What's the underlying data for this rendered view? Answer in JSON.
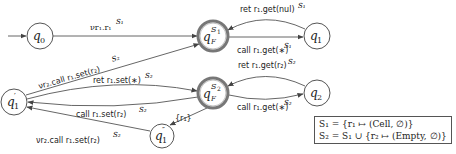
{
  "diagram": {
    "type": "automaton",
    "states": [
      {
        "id": "q0",
        "label": "q0",
        "initial": true,
        "final": false
      },
      {
        "id": "qF_S1",
        "label": "qF",
        "superscript": "S1",
        "final": true
      },
      {
        "id": "q1",
        "label": "q1",
        "final": false
      },
      {
        "id": "q1p",
        "label": "q1′",
        "final": false
      },
      {
        "id": "qF_S2",
        "label": "qF",
        "superscript": "S2",
        "final": true
      },
      {
        "id": "q2",
        "label": "q2",
        "final": false
      },
      {
        "id": "q1pp",
        "label": "q1″",
        "final": false
      }
    ],
    "edges": [
      {
        "from": "q0",
        "to": "qF_S1",
        "label": "ν r1.r1",
        "sup": "S1"
      },
      {
        "from": "q1",
        "to": "qF_S1",
        "label": "ret r1.get(nul)",
        "sup": "S1"
      },
      {
        "from": "qF_S1",
        "to": "q1",
        "label": "call r1.get(∗)",
        "sup": "S1"
      },
      {
        "from": "q1p",
        "to": "qF_S1",
        "label": "ν r2.call r1.set(r2)",
        "sup": "S2"
      },
      {
        "from": "q1p",
        "to": "qF_S2",
        "label": "ret r1.set(∗)",
        "sup": "S2"
      },
      {
        "from": "qF_S2",
        "to": "q1p",
        "label": "call r1.set(r2)",
        "sup": "S2"
      },
      {
        "from": "q2",
        "to": "qF_S2",
        "label": "ret r1.get(r2)",
        "sup": "S2"
      },
      {
        "from": "qF_S2",
        "to": "q2",
        "label": "call r1.get(∗)",
        "sup": "S2"
      },
      {
        "from": "qF_S2",
        "to": "q1pp",
        "label": "{r1}",
        "sup": ""
      },
      {
        "from": "q1pp",
        "to": "q1p",
        "label": "ν r2.call r1.set(r2)",
        "sup": "S2"
      }
    ],
    "legend": {
      "line1": "S₁ = {r₁ ↦ (Cell, ∅)}",
      "line2": "S₂ = S₁ ∪ {r₂ ↦ (Empty, ∅)}"
    }
  },
  "labels": {
    "q0": "q",
    "q0_sub": "0",
    "qF": "q",
    "qF_sub": "F",
    "S1": "S",
    "S1_sub": "1",
    "S2": "S",
    "S2_sub": "2",
    "q1": "q",
    "q1_sub": "1",
    "q2": "q",
    "q2_sub": "2",
    "q1p_prime": "′",
    "q1pp_prime": "″",
    "e_q0_qF1": "νr₁.r₁",
    "e_q0_qF1_sup": "S₁",
    "e_q1_qF1": "ret r₁.get(nul)",
    "e_q1_qF1_sup": "S₁",
    "e_qF1_q1": "call r₁.get(∗)",
    "e_qF1_q1_sup": "S₁",
    "e_q1p_qF1": "νr₂.call r₁.set(r₂)",
    "e_q1p_qF1_sup": "S₂",
    "e_q1p_qF2": "ret r₁.set(∗)",
    "e_q1p_qF2_sup": "S₂",
    "e_qF2_q1p": "call r₁.set(r₂)",
    "e_qF2_q1p_sup": "S₂",
    "e_q2_qF2": "ret r₁.get(r₂)",
    "e_q2_qF2_sup": "S₂",
    "e_qF2_q2": "call r₁.get(∗)",
    "e_qF2_q2_sup": "S₂",
    "e_qF2_q1pp": "{r₁}",
    "e_q1pp_q1p": "νr₂.call r₁.set(r₂)",
    "e_q1pp_q1p_sup": "S₂",
    "legend_line1": "S₁ = {r₁ ↦ (Cell, ∅)}",
    "legend_line2": "S₂ = S₁ ∪ {r₂ ↦ (Empty, ∅)}"
  }
}
